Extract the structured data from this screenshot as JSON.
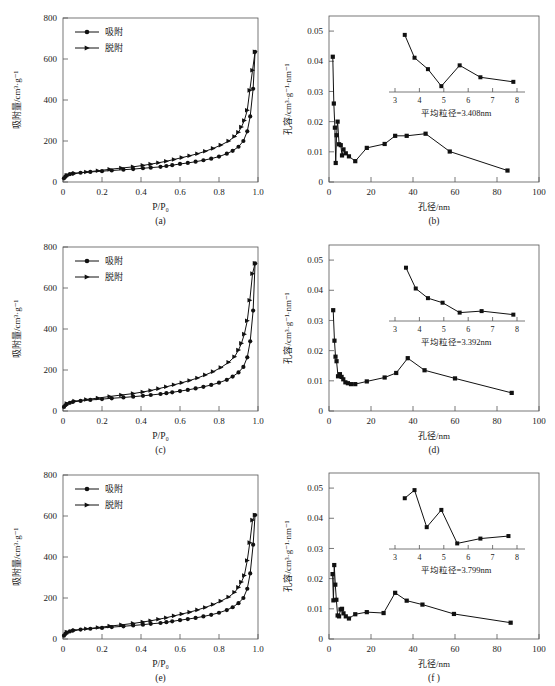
{
  "figure": {
    "panels": [
      "a",
      "b",
      "c",
      "d",
      "e",
      "f"
    ],
    "label_a": "(a)",
    "label_b": "(b)",
    "label_c": "(c)",
    "label_d": "(d)",
    "label_e": "(e)",
    "label_f": "(f)"
  },
  "isotherm_common": {
    "xlabel": "P/P₀",
    "ylabel": "吸附量/cm³·g⁻¹",
    "xticks": [
      "0",
      "0.2",
      "0.4",
      "0.6",
      "0.8",
      "1.0"
    ],
    "yticks": [
      "0",
      "200",
      "400",
      "600",
      "800"
    ],
    "legend": {
      "adsorption": "吸附",
      "desorption": "脱附"
    }
  },
  "psd_common": {
    "xlabel": "孔径/nm",
    "ylabel": "孔容/cm³·g⁻¹·nm⁻¹",
    "xticks": [
      "0",
      "20",
      "40",
      "60",
      "80",
      "100"
    ],
    "yticks": [
      "0",
      "0.01",
      "0.02",
      "0.03",
      "0.04",
      "0.05"
    ],
    "inset_xticks": [
      "3",
      "4",
      "5",
      "6",
      "7",
      "8"
    ]
  },
  "chart_data": [
    {
      "type": "line",
      "panel": "a",
      "title": "(a)",
      "xlabel": "P/P₀",
      "ylabel": "吸附量/cm³·g⁻¹",
      "xlim": [
        0,
        1.0
      ],
      "ylim": [
        0,
        800
      ],
      "grid": false,
      "legend_position": "upper-left",
      "series": [
        {
          "name": "吸附",
          "marker": "circle",
          "x": [
            0.005,
            0.012,
            0.02,
            0.035,
            0.05,
            0.09,
            0.14,
            0.2,
            0.25,
            0.31,
            0.36,
            0.41,
            0.45,
            0.5,
            0.53,
            0.56,
            0.6,
            0.64,
            0.68,
            0.72,
            0.76,
            0.8,
            0.84,
            0.87,
            0.9,
            0.925,
            0.945,
            0.96,
            0.975,
            0.985
          ],
          "y": [
            18,
            26,
            32,
            38,
            41,
            45,
            49,
            53,
            56,
            60,
            63,
            67,
            70,
            74,
            78,
            82,
            88,
            93,
            99,
            106,
            114,
            124,
            138,
            152,
            172,
            200,
            247,
            320,
            455,
            635
          ]
        },
        {
          "name": "脱附",
          "marker": "triangle",
          "x": [
            0.985,
            0.972,
            0.958,
            0.945,
            0.93,
            0.915,
            0.9,
            0.88,
            0.85,
            0.81,
            0.77,
            0.73,
            0.69,
            0.65,
            0.61,
            0.57,
            0.53,
            0.49,
            0.45,
            0.41,
            0.36,
            0.3,
            0.24,
            0.18,
            0.12,
            0.06,
            0.02
          ],
          "y": [
            635,
            545,
            447,
            350,
            300,
            268,
            243,
            222,
            200,
            180,
            164,
            150,
            138,
            128,
            119,
            110,
            101,
            94,
            87,
            81,
            74,
            68,
            62,
            55,
            49,
            42,
            33
          ]
        }
      ]
    },
    {
      "type": "line",
      "panel": "b",
      "title": "(b)",
      "xlabel": "孔径/nm",
      "ylabel": "孔容/cm³·g⁻¹·nm⁻¹",
      "xlim": [
        0,
        100
      ],
      "ylim": [
        0,
        0.055
      ],
      "grid": false,
      "inset_caption": "平均粒径=3.408nm",
      "x": [
        1.8,
        2.3,
        2.8,
        3.2,
        3.6,
        4.1,
        4.8,
        5.6,
        6.2,
        6.9,
        8.0,
        9.5,
        12.5,
        18.0,
        26.5,
        31.5,
        37.0,
        46.0,
        57.5,
        85.0
      ],
      "y": [
        0.0415,
        0.026,
        0.018,
        0.0063,
        0.0155,
        0.02,
        0.0125,
        0.0122,
        0.0088,
        0.0108,
        0.0095,
        0.0085,
        0.0069,
        0.0113,
        0.0126,
        0.0153,
        0.0153,
        0.016,
        0.0101,
        0.0038
      ],
      "inset": {
        "xlim": [
          3,
          8
        ],
        "x": [
          3.4,
          3.8,
          4.35,
          4.9,
          5.65,
          6.5,
          7.85
        ],
        "y": [
          0.0505,
          0.0415,
          0.037,
          0.0303,
          0.0385,
          0.0338,
          0.032
        ],
        "xticks": [
          "3",
          "4",
          "5",
          "6",
          "7",
          "8"
        ]
      }
    },
    {
      "type": "line",
      "panel": "c",
      "title": "(c)",
      "xlabel": "P/P₀",
      "ylabel": "吸附量/cm³·g⁻¹",
      "xlim": [
        0,
        1.0
      ],
      "ylim": [
        0,
        800
      ],
      "grid": false,
      "legend_position": "upper-left",
      "series": [
        {
          "name": "吸附",
          "marker": "circle",
          "x": [
            0.005,
            0.012,
            0.02,
            0.035,
            0.05,
            0.09,
            0.14,
            0.2,
            0.25,
            0.31,
            0.36,
            0.41,
            0.45,
            0.5,
            0.53,
            0.56,
            0.6,
            0.64,
            0.68,
            0.72,
            0.76,
            0.8,
            0.84,
            0.87,
            0.9,
            0.925,
            0.945,
            0.96,
            0.975,
            0.985
          ],
          "y": [
            20,
            28,
            34,
            40,
            44,
            49,
            54,
            58,
            62,
            66,
            70,
            74,
            78,
            83,
            87,
            91,
            97,
            103,
            110,
            118,
            127,
            138,
            152,
            168,
            188,
            215,
            262,
            340,
            490,
            720
          ]
        },
        {
          "name": "脱附",
          "marker": "triangle",
          "x": [
            0.985,
            0.972,
            0.958,
            0.945,
            0.93,
            0.915,
            0.9,
            0.88,
            0.85,
            0.81,
            0.77,
            0.73,
            0.69,
            0.65,
            0.61,
            0.57,
            0.53,
            0.49,
            0.45,
            0.41,
            0.36,
            0.3,
            0.24,
            0.18,
            0.12,
            0.06,
            0.02
          ],
          "y": [
            720,
            670,
            540,
            440,
            375,
            330,
            297,
            265,
            238,
            212,
            192,
            176,
            161,
            149,
            138,
            128,
            118,
            109,
            100,
            93,
            85,
            78,
            71,
            63,
            56,
            48,
            36
          ]
        }
      ]
    },
    {
      "type": "line",
      "panel": "d",
      "title": "(d)",
      "xlabel": "孔径/nm",
      "ylabel": "孔容/cm³·g⁻¹·nm⁻¹",
      "xlim": [
        0,
        100
      ],
      "ylim": [
        0,
        0.055
      ],
      "grid": false,
      "inset_caption": "平均粒径=3.392nm",
      "x": [
        2.0,
        2.6,
        3.1,
        3.6,
        4.3,
        5.2,
        6.0,
        6.8,
        7.8,
        9.0,
        10.5,
        12.5,
        18.0,
        26.5,
        32.0,
        37.5,
        45.5,
        60.0,
        87.0
      ],
      "y": [
        0.0334,
        0.0233,
        0.018,
        0.0165,
        0.0115,
        0.0122,
        0.0113,
        0.0105,
        0.0095,
        0.0092,
        0.0089,
        0.0089,
        0.0098,
        0.0111,
        0.0126,
        0.0175,
        0.0135,
        0.0108,
        0.006
      ],
      "inset": {
        "xlim": [
          3,
          8
        ],
        "x": [
          3.45,
          3.85,
          4.35,
          4.95,
          5.65,
          6.55,
          7.85
        ],
        "y": [
          0.049,
          0.0408,
          0.037,
          0.0352,
          0.0313,
          0.0319,
          0.0305
        ],
        "xticks": [
          "3",
          "4",
          "5",
          "6",
          "7",
          "8"
        ]
      }
    },
    {
      "type": "line",
      "panel": "e",
      "title": "(e)",
      "xlabel": "P/P₀",
      "ylabel": "吸附量/cm³·g⁻¹",
      "xlim": [
        0,
        1.0
      ],
      "ylim": [
        0,
        800
      ],
      "grid": false,
      "legend_position": "upper-left",
      "series": [
        {
          "name": "吸附",
          "marker": "circle",
          "x": [
            0.005,
            0.012,
            0.02,
            0.035,
            0.05,
            0.09,
            0.14,
            0.2,
            0.25,
            0.31,
            0.36,
            0.41,
            0.45,
            0.5,
            0.53,
            0.56,
            0.6,
            0.64,
            0.68,
            0.72,
            0.76,
            0.8,
            0.84,
            0.87,
            0.9,
            0.925,
            0.945,
            0.96,
            0.975,
            0.985
          ],
          "y": [
            16,
            25,
            31,
            37,
            41,
            46,
            50,
            54,
            58,
            62,
            66,
            70,
            74,
            78,
            82,
            86,
            92,
            97,
            103,
            110,
            118,
            128,
            141,
            155,
            175,
            200,
            245,
            320,
            460,
            605
          ]
        },
        {
          "name": "脱附",
          "marker": "triangle",
          "x": [
            0.985,
            0.972,
            0.958,
            0.945,
            0.93,
            0.915,
            0.9,
            0.88,
            0.85,
            0.81,
            0.77,
            0.73,
            0.69,
            0.65,
            0.61,
            0.57,
            0.53,
            0.49,
            0.45,
            0.41,
            0.36,
            0.3,
            0.24,
            0.18,
            0.12,
            0.06,
            0.02
          ],
          "y": [
            605,
            580,
            470,
            383,
            310,
            278,
            252,
            228,
            205,
            185,
            168,
            154,
            142,
            131,
            122,
            113,
            104,
            96,
            89,
            83,
            76,
            69,
            63,
            56,
            50,
            43,
            34
          ]
        }
      ]
    },
    {
      "type": "line",
      "panel": "f",
      "title": "(f )",
      "xlabel": "孔径/nm",
      "ylabel": "孔容/cm³·g⁻¹·nm⁻¹",
      "xlim": [
        0,
        100
      ],
      "ylim": [
        0,
        0.055
      ],
      "grid": false,
      "inset_caption": "平均粒径=3.799nm",
      "x": [
        1.7,
        2.1,
        2.5,
        3.0,
        3.5,
        4.1,
        4.8,
        5.5,
        6.2,
        6.9,
        8.0,
        9.5,
        12.5,
        18.0,
        26.0,
        31.5,
        37.0,
        44.5,
        59.5,
        86.5
      ],
      "y": [
        0.0215,
        0.0128,
        0.0245,
        0.018,
        0.013,
        0.0078,
        0.0075,
        0.0098,
        0.01,
        0.0085,
        0.0075,
        0.0068,
        0.0082,
        0.0089,
        0.0086,
        0.0153,
        0.0127,
        0.0114,
        0.0083,
        0.0054
      ],
      "inset": {
        "xlim": [
          3,
          8
        ],
        "x": [
          3.4,
          3.8,
          4.3,
          4.9,
          5.55,
          6.5,
          7.65
        ],
        "y": [
          0.048,
          0.0512,
          0.0366,
          0.0434,
          0.0302,
          0.0321,
          0.0331
        ],
        "xticks": [
          "3",
          "4",
          "5",
          "6",
          "7",
          "8"
        ]
      }
    }
  ]
}
